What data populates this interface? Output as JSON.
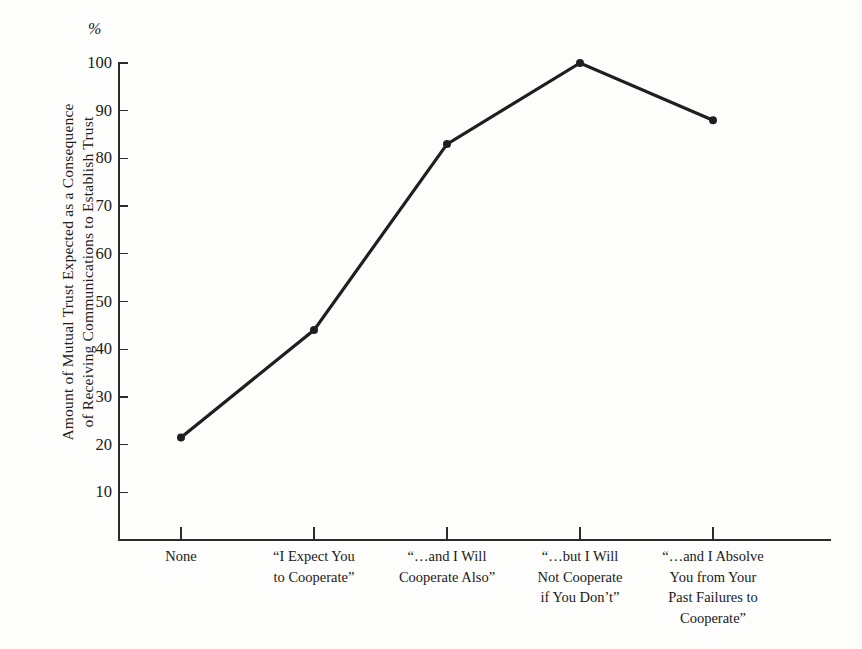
{
  "chart_data": {
    "type": "line",
    "title": "",
    "subtitle": "",
    "unit_symbol": "%",
    "ylabel_line1": "Amount of Mutual Trust Expected as a Consequence",
    "ylabel_line2": "of Receiving Communications to Establish Trust",
    "xlabel": "",
    "ylim": [
      0,
      100
    ],
    "ytick_values": [
      10,
      20,
      30,
      40,
      50,
      60,
      70,
      80,
      90,
      100
    ],
    "ytick_labels": [
      "10",
      "20",
      "30",
      "40",
      "50",
      "60",
      "70",
      "80",
      "90",
      "100"
    ],
    "grid": false,
    "legend": "none",
    "marker": "filled-circle",
    "line_color": "#1f1f1f",
    "categories": [
      "None",
      "“I Expect You to Cooperate”",
      "“…and I Will Cooperate Also”",
      "“…but I Will Not Cooperate if You Don’t”",
      "“…and I Absolve You from Your Past Failures to Cooperate”"
    ],
    "category_lines": [
      [
        "None"
      ],
      [
        "“I Expect You",
        "to Cooperate”"
      ],
      [
        "“…and I Will",
        "Cooperate Also”"
      ],
      [
        "“…but I Will",
        "Not Cooperate",
        "if You Don’t”"
      ],
      [
        "“…and I Absolve",
        "You from Your",
        "Past Failures to",
        "Cooperate”"
      ]
    ],
    "values": [
      21.5,
      44,
      83,
      100,
      88
    ],
    "series": [
      {
        "name": "Mutual Trust Expected",
        "values": [
          21.5,
          44,
          83,
          100,
          88
        ]
      }
    ]
  }
}
